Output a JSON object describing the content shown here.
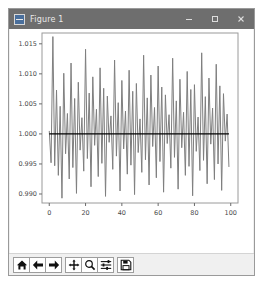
{
  "window": {
    "title": "Figure 1",
    "icon": "matplotlib-figure-icon",
    "controls": {
      "minimize": "–",
      "maximize": "☐",
      "close": "×"
    },
    "titlebar_color": "#6e6e6e",
    "frame_color": "#9a9a9a",
    "background_color": "#f0f0f0"
  },
  "toolbar": {
    "buttons": [
      {
        "name": "home-icon",
        "tooltip": "Home"
      },
      {
        "name": "back-arrow-icon",
        "tooltip": "Back"
      },
      {
        "name": "forward-arrow-icon",
        "tooltip": "Forward"
      },
      {
        "name": "pan-move-icon",
        "tooltip": "Pan"
      },
      {
        "name": "zoom-magnifier-icon",
        "tooltip": "Zoom to rectangle"
      },
      {
        "name": "configure-subplots-icon",
        "tooltip": "Configure subplots"
      },
      {
        "name": "save-floppy-icon",
        "tooltip": "Save the figure"
      }
    ]
  },
  "chart_data": {
    "type": "line",
    "title": "",
    "xlabel": "",
    "ylabel": "",
    "xlim": [
      -4,
      104
    ],
    "ylim": [
      0.9885,
      1.0168
    ],
    "xticks": [
      0,
      20,
      40,
      60,
      80,
      100
    ],
    "xticklabels": [
      "0",
      "20",
      "40",
      "60",
      "80",
      "100"
    ],
    "yticks": [
      0.99,
      0.995,
      1.0,
      1.005,
      1.01,
      1.015
    ],
    "yticklabels": [
      "0.990",
      "0.995",
      "1.000",
      "1.005",
      "1.010",
      "1.015"
    ],
    "grid": false,
    "legend": null,
    "series": [
      {
        "name": "noisy-signal",
        "color": "#7f7f7f",
        "linewidth": 1,
        "x": [
          0,
          1,
          2,
          3,
          4,
          5,
          6,
          7,
          8,
          9,
          10,
          11,
          12,
          13,
          14,
          15,
          16,
          17,
          18,
          19,
          20,
          21,
          22,
          23,
          24,
          25,
          26,
          27,
          28,
          29,
          30,
          31,
          32,
          33,
          34,
          35,
          36,
          37,
          38,
          39,
          40,
          41,
          42,
          43,
          44,
          45,
          46,
          47,
          48,
          49,
          50,
          51,
          52,
          53,
          54,
          55,
          56,
          57,
          58,
          59,
          60,
          61,
          62,
          63,
          64,
          65,
          66,
          67,
          68,
          69,
          70,
          71,
          72,
          73,
          74,
          75,
          76,
          77,
          78,
          79,
          80,
          81,
          82,
          83,
          84,
          85,
          86,
          87,
          88,
          89,
          90,
          91,
          92,
          93,
          94,
          95,
          96,
          97,
          98,
          99
        ],
        "y": [
          1.0005,
          0.9952,
          1.0162,
          0.9947,
          1.0073,
          0.9931,
          1.0046,
          0.9893,
          1.0101,
          0.9967,
          1.0034,
          0.9925,
          1.0118,
          0.9944,
          1.0059,
          0.9901,
          1.0086,
          0.9973,
          1.0027,
          0.9938,
          1.0141,
          0.9959,
          1.0068,
          0.9912,
          1.0095,
          0.9981,
          1.0041,
          0.9929,
          1.011,
          0.9951,
          1.0076,
          0.9896,
          1.0063,
          0.9986,
          1.003,
          0.9941,
          1.0123,
          0.9963,
          1.0052,
          0.9905,
          1.0089,
          0.9975,
          1.0038,
          0.9933,
          1.0106,
          0.9948,
          1.0071,
          0.9899,
          1.0084,
          0.9969,
          1.0025,
          0.9936,
          1.0131,
          0.9957,
          1.006,
          0.9915,
          1.0098,
          0.9979,
          1.0044,
          0.9927,
          1.0113,
          0.9954,
          1.0078,
          0.9903,
          1.0065,
          0.9984,
          1.0032,
          0.9943,
          1.0126,
          0.9961,
          1.0055,
          0.9908,
          1.0091,
          0.9977,
          1.0036,
          0.9931,
          1.0104,
          0.9946,
          1.0074,
          0.9897,
          1.0082,
          0.9971,
          1.0028,
          0.9939,
          1.0135,
          0.9956,
          1.0062,
          0.9917,
          1.0093,
          0.9983,
          1.0043,
          0.9924,
          1.0116,
          0.995,
          1.008,
          0.9906,
          1.0067,
          0.9988,
          1.0033,
          0.9945
        ]
      },
      {
        "name": "reference-line",
        "color": "#000000",
        "linewidth": 1.2,
        "x": [
          0,
          99
        ],
        "y": [
          1.0,
          1.0
        ]
      }
    ]
  }
}
